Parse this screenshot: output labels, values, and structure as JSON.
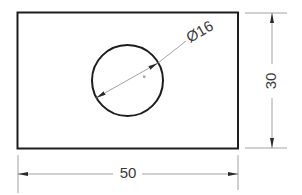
{
  "drawing": {
    "type": "technical-drawing",
    "part": "rectangular plate with circular hole",
    "colors": {
      "outline": "#1e1e1e",
      "dimension": "#8a8a8a",
      "arrow": "#2a2a2a",
      "text": "#3a3a3a",
      "center_mark": "#a8a8a8"
    },
    "plate": {
      "width": 50,
      "height": 30
    },
    "hole": {
      "diameter": 16
    },
    "dimensions": {
      "width_label": "50",
      "height_label": "30",
      "diameter_label": "Ø16"
    }
  }
}
